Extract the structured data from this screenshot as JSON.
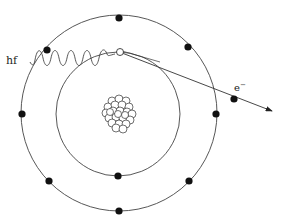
{
  "diagram": {
    "labels": {
      "photon": "hf",
      "electron": "e",
      "electron_superscript": "−"
    },
    "nucleus": {
      "cx": 119,
      "cy": 112,
      "nucleon_count": 24
    },
    "orbits": [
      {
        "name": "inner-shell",
        "r": 62
      },
      {
        "name": "outer-shell",
        "r": 100
      }
    ],
    "colors": {
      "line": "#444444",
      "electron": "#111111",
      "background": "#ffffff"
    }
  }
}
